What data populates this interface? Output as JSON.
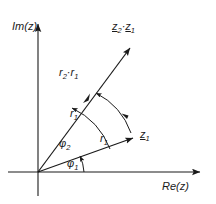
{
  "figure": {
    "background": "#ffffff",
    "ink": "#1a1a1a",
    "axes": {
      "imaginary_label": "Im(z)",
      "real_label": "Re(z)"
    },
    "labels": {
      "product_vector": {
        "base1": "z",
        "sub1": "2",
        "dot": "·",
        "base2": "z",
        "sub2": "1"
      },
      "product_magnitude": {
        "base1": "r",
        "sub1": "2",
        "dot": "·",
        "base2": "r",
        "sub2": "1"
      },
      "upper_magnitude": {
        "base": "r",
        "sub": "1"
      },
      "lower_magnitude": {
        "base": "r",
        "sub": "1"
      },
      "z1_vector": {
        "base": "z",
        "sub": "1"
      },
      "angle_upper": {
        "base": "φ",
        "sub": "2"
      },
      "angle_lower": {
        "base": "φ",
        "sub": "1"
      }
    },
    "geometry": {
      "origin_x": 38,
      "origin_y": 172,
      "im_axis_top_y": 18,
      "re_axis_right_x": 205,
      "z1_tip_x": 138,
      "z1_tip_y": 137,
      "product_tip_x": 133,
      "product_tip_y": 45
    }
  }
}
